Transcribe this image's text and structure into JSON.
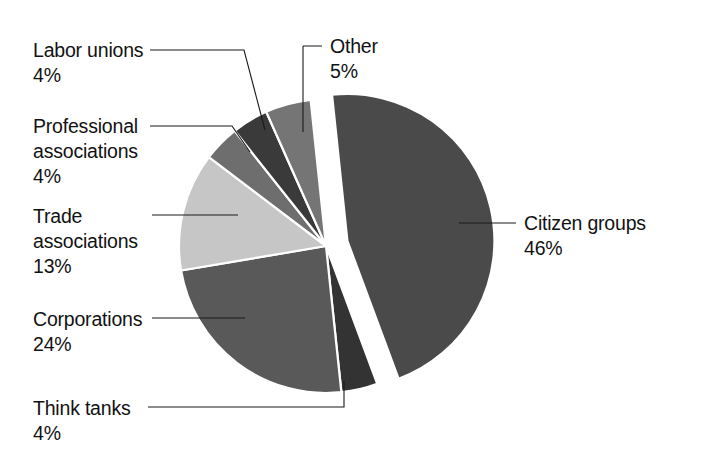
{
  "chart_data": {
    "type": "pie",
    "title": "",
    "subtitle": "",
    "xlabel": "",
    "ylabel": "",
    "legend_position": "callout-labels",
    "grid": false,
    "unit": "%",
    "categories": [
      "Citizen groups",
      "Other",
      "Labor unions",
      "Professional associations",
      "Trade associations",
      "Corporations",
      "Think tanks"
    ],
    "values": [
      46,
      5,
      4,
      4,
      13,
      24,
      4
    ],
    "slices": [
      {
        "label": "Citizen groups",
        "percent": 46,
        "percent_text": "46%",
        "color": "#4a4a4a",
        "exploded": true
      },
      {
        "label": "Other",
        "percent": 5,
        "percent_text": "5%",
        "color": "#757575",
        "exploded": false
      },
      {
        "label": "Labor unions",
        "percent": 4,
        "percent_text": "4%",
        "color": "#3a3a3a",
        "exploded": false
      },
      {
        "label": "Professional associations",
        "percent": 4,
        "percent_text": "4%",
        "color": "#6e6e6e",
        "exploded": false
      },
      {
        "label": "Trade associations",
        "percent": 13,
        "percent_text": "13%",
        "color": "#c6c6c6",
        "exploded": false
      },
      {
        "label": "Corporations",
        "percent": 24,
        "percent_text": "24%",
        "color": "#595959",
        "exploded": false
      },
      {
        "label": "Think tanks",
        "percent": 4,
        "percent_text": "4%",
        "color": "#333333",
        "exploded": false
      }
    ]
  },
  "labels": {
    "labor_unions": {
      "name": "Labor unions",
      "percent": "4%"
    },
    "professional_associations": {
      "line1": "Professional",
      "line2": "associations",
      "percent": "4%"
    },
    "trade_associations": {
      "line1": "Trade",
      "line2": "associations",
      "percent": "13%"
    },
    "corporations": {
      "name": "Corporations",
      "percent": "24%"
    },
    "think_tanks": {
      "name": "Think tanks",
      "percent": "4%"
    },
    "other": {
      "name": "Other",
      "percent": "5%"
    },
    "citizen_groups": {
      "name": "Citizen groups",
      "percent": "46%"
    }
  },
  "colors": {
    "background": "#ffffff",
    "text": "#121212",
    "leader_line": "#1a1a1a",
    "slice_border": "#ffffff"
  }
}
